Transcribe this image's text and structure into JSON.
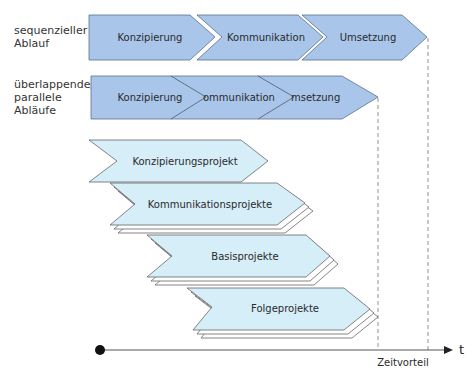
{
  "rows": {
    "sequential": {
      "label_line1": "sequenzieller",
      "label_line2": "Ablauf",
      "phases": [
        "Konzipierung",
        "Kommunikation",
        "Umsetzung"
      ]
    },
    "parallel": {
      "label_line1": "überlappende/",
      "label_line2": "parallele",
      "label_line3": "Abläufe",
      "phases": [
        "Konzipierung",
        "ommunikation",
        "msetzung"
      ]
    }
  },
  "projects": [
    {
      "label": "Konzipierungsprojekt",
      "stacked": false
    },
    {
      "label": "Kommunikationsprojekte",
      "stacked": true
    },
    {
      "label": "Basisprojekte",
      "stacked": true
    },
    {
      "label": "Folgeprojekte",
      "stacked": true
    }
  ],
  "axis": {
    "label": "t",
    "advantage_label": "Zeitvorteil",
    "start_marker": "dot"
  },
  "colors": {
    "phase_fill": "#a9c6ea",
    "phase_stroke": "#5a6f8c",
    "project_fill": "#d6eef8",
    "project_stroke": "#666666",
    "axis": "#333333"
  }
}
